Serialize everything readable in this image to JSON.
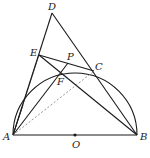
{
  "diagram": {
    "type": "geometry",
    "points": {
      "A": {
        "label": "A",
        "x": 13,
        "y": 135
      },
      "B": {
        "label": "B",
        "x": 137,
        "y": 135
      },
      "O": {
        "label": "O",
        "x": 75,
        "y": 135
      },
      "C": {
        "label": "C",
        "x": 94,
        "y": 71
      },
      "D": {
        "label": "D",
        "x": 52,
        "y": 13
      },
      "E": {
        "label": "E",
        "x": 39,
        "y": 55
      },
      "F": {
        "label": "F",
        "x": 61,
        "y": 71
      },
      "P": {
        "label": "P",
        "x": 68,
        "y": 63
      }
    },
    "labels": {
      "A": "A",
      "B": "B",
      "O": "O",
      "C": "C",
      "D": "D",
      "E": "E",
      "F": "F",
      "P": "P"
    },
    "semicircle": {
      "center": "O",
      "radius": 62
    },
    "segments": [
      [
        "A",
        "B"
      ],
      [
        "A",
        "D"
      ],
      [
        "D",
        "B"
      ],
      [
        "E",
        "C"
      ],
      [
        "E",
        "B"
      ],
      [
        "A",
        "P"
      ],
      [
        "F",
        "P"
      ]
    ],
    "dashed_segments": [
      [
        "A",
        "C"
      ]
    ],
    "colors": {
      "stroke": "#1a1a1a",
      "dashed": "#777777"
    }
  }
}
